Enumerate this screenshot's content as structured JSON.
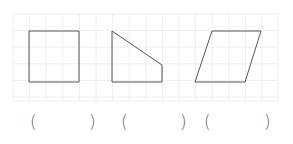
{
  "grid": {
    "x": 13,
    "y": 14,
    "width": 265,
    "height": 87,
    "cell": 16.6,
    "line_color": "#eeeeee"
  },
  "shapes": [
    {
      "name": "square",
      "points": "29,31 79,31 79,82 29,82"
    },
    {
      "name": "trapezoid",
      "points": "112,31 162,65 162,82 112,82"
    },
    {
      "name": "parallelogram",
      "points": "212,31 261,31 245,82 195,82"
    }
  ],
  "stroke_color": "#555555",
  "answers": [
    {
      "open": "(",
      "close": ")"
    },
    {
      "open": "(",
      "close": ")"
    },
    {
      "open": "(",
      "close": ")"
    }
  ]
}
